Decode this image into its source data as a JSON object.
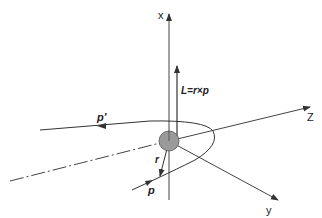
{
  "diagram": {
    "axes": {
      "x": {
        "label": "x"
      },
      "y": {
        "label": "y"
      },
      "z": {
        "label": "Z"
      }
    },
    "vectors": {
      "angular_momentum": {
        "label": "L=r×p"
      },
      "incoming_momentum": {
        "label": "p"
      },
      "outgoing_momentum": {
        "label": "p'"
      },
      "position": {
        "label": "r"
      }
    },
    "elements": {
      "nucleus": {
        "description": "scattering center",
        "fill": "#999999"
      },
      "trajectory": {
        "description": "hyperbolic trajectory of scattered particle"
      },
      "asymptote": {
        "description": "dash-dot incoming asymptote line"
      }
    },
    "colors": {
      "line": "#333333",
      "nucleus_fill": "#9a9a9a",
      "background": "#ffffff"
    }
  }
}
